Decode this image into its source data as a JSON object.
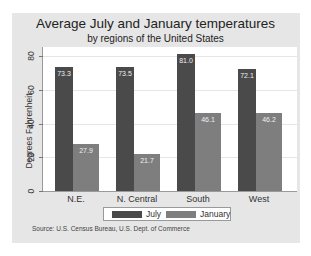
{
  "chart_data": {
    "type": "bar",
    "title": "Average July and January temperatures",
    "subtitle": "by regions of the United States",
    "xlabel": "",
    "ylabel": "Degrees Fahrenheit",
    "ylim": [
      0,
      80
    ],
    "yticks": [
      0,
      20,
      40,
      60,
      80
    ],
    "grid": true,
    "legend_position": "bottom",
    "categories": [
      "N.E.",
      "N. Central",
      "South",
      "West"
    ],
    "series": [
      {
        "name": "July",
        "color": "#4a4a4a",
        "values": [
          73.3,
          73.5,
          81.0,
          72.1
        ],
        "labels": [
          "73.3",
          "73.5",
          "81.0",
          "72.1"
        ]
      },
      {
        "name": "January",
        "color": "#7e7e7e",
        "values": [
          27.9,
          21.7,
          46.1,
          46.2
        ],
        "labels": [
          "27.9",
          "21.7",
          "46.1",
          "46.2"
        ]
      }
    ],
    "note": "Source:  U.S. Census Bureau, U.S. Dept. of Commerce"
  }
}
